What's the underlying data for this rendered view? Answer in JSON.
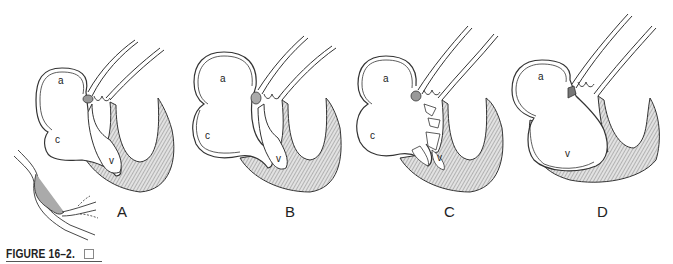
{
  "figure": {
    "caption": "FIGURE 16–2.",
    "caption_box_icon": "empty-square-icon",
    "stroke_color": "#333333",
    "shading_color": "#bdbdbd",
    "panels": [
      {
        "letter": "A",
        "labels": {
          "a": "a",
          "c": "c",
          "v": "v"
        }
      },
      {
        "letter": "B",
        "labels": {
          "a": "a",
          "c": "c",
          "v": "v"
        }
      },
      {
        "letter": "C",
        "labels": {
          "a": "a",
          "c": "c",
          "v": "v"
        }
      },
      {
        "letter": "D",
        "labels": {
          "a": "a",
          "v": "v"
        }
      }
    ]
  }
}
